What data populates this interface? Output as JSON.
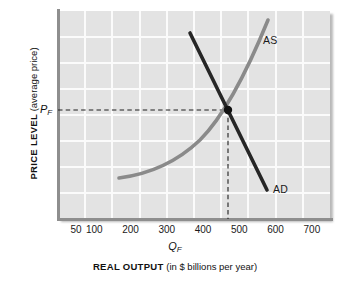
{
  "chart_data": {
    "type": "line",
    "title": "",
    "xlabel_bold": "REAL OUTPUT",
    "xlabel_light": "(in $ billions per year)",
    "ylabel_bold": "PRICE LEVEL",
    "ylabel_light": "(average price)",
    "x_tick_labels": [
      "50",
      "100",
      "200",
      "300",
      "400",
      "500",
      "600",
      "700"
    ],
    "x_tick_values": [
      50,
      100,
      200,
      300,
      400,
      500,
      600,
      700
    ],
    "xlim": [
      0,
      750
    ],
    "ylim": [
      0,
      10
    ],
    "grid": true,
    "grid_color": "#fbfbfb",
    "plot_background": "#e3e3e3",
    "legend_position": "inline-curve-labels",
    "series": [
      {
        "name": "AS",
        "label": "AS",
        "color": "#8a8a8a",
        "style": "curve-convex-increasing",
        "points": [
          {
            "x": 190,
            "y": 2.0
          },
          {
            "x": 250,
            "y": 2.3
          },
          {
            "x": 320,
            "y": 2.9
          },
          {
            "x": 390,
            "y": 3.9
          },
          {
            "x": 450,
            "y": 5.0
          },
          {
            "x": 500,
            "y": 6.1
          },
          {
            "x": 545,
            "y": 7.4
          },
          {
            "x": 585,
            "y": 9.1
          }
        ]
      },
      {
        "name": "AD",
        "label": "AD",
        "color": "#262626",
        "style": "straight-decreasing",
        "points": [
          {
            "x": 400,
            "y": 8.4
          },
          {
            "x": 500,
            "y": 6.1
          },
          {
            "x": 585,
            "y": 1.5
          }
        ]
      }
    ],
    "equilibrium": {
      "x_value": 500,
      "x_label": "Q",
      "x_label_sub": "F",
      "y_label": "P",
      "y_label_sub": "F",
      "marker_color": "#111111",
      "guide_line_style": "dashed"
    },
    "annotations": [
      {
        "text": "AS",
        "kind": "curve-label"
      },
      {
        "text": "AD",
        "kind": "curve-label"
      },
      {
        "text": "P",
        "sub": "F",
        "kind": "axis-marker"
      },
      {
        "text": "Q",
        "sub": "F",
        "kind": "axis-marker"
      }
    ]
  }
}
